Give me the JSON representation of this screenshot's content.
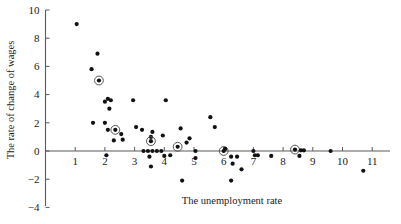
{
  "chart_data": {
    "type": "scatter",
    "title": "",
    "xlabel": "The unemployment rate",
    "ylabel": "The rate of change of wages",
    "xlim": [
      0,
      11.45
    ],
    "ylim": [
      -4,
      10
    ],
    "xticks": [
      1,
      2,
      3,
      4,
      5,
      6,
      7,
      8,
      9,
      10,
      11
    ],
    "yticks": [
      -4,
      -2,
      0,
      2,
      4,
      6,
      8,
      10
    ],
    "grid": false,
    "legend": null,
    "marker": "filled-circle",
    "highlight_marker": "filled-circle-with-ring",
    "points": [
      {
        "x": 1.05,
        "y": 9.0,
        "highlight": false
      },
      {
        "x": 1.55,
        "y": 5.8,
        "highlight": false
      },
      {
        "x": 1.75,
        "y": 6.9,
        "highlight": false
      },
      {
        "x": 1.8,
        "y": 5.0,
        "highlight": true
      },
      {
        "x": 1.6,
        "y": 2.0,
        "highlight": false
      },
      {
        "x": 2.0,
        "y": 3.5,
        "highlight": false
      },
      {
        "x": 2.1,
        "y": 3.7,
        "highlight": false
      },
      {
        "x": 2.15,
        "y": 3.0,
        "highlight": false
      },
      {
        "x": 2.0,
        "y": 2.0,
        "highlight": false
      },
      {
        "x": 2.1,
        "y": 1.5,
        "highlight": false
      },
      {
        "x": 2.2,
        "y": 3.6,
        "highlight": false
      },
      {
        "x": 2.35,
        "y": 1.5,
        "highlight": true
      },
      {
        "x": 2.05,
        "y": -0.3,
        "highlight": false
      },
      {
        "x": 2.3,
        "y": 0.75,
        "highlight": false
      },
      {
        "x": 2.6,
        "y": 0.8,
        "highlight": false
      },
      {
        "x": 2.55,
        "y": 1.2,
        "highlight": false
      },
      {
        "x": 2.95,
        "y": 3.6,
        "highlight": false
      },
      {
        "x": 3.05,
        "y": 1.7,
        "highlight": false
      },
      {
        "x": 3.25,
        "y": 1.5,
        "highlight": false
      },
      {
        "x": 3.3,
        "y": 0.0,
        "highlight": false
      },
      {
        "x": 3.45,
        "y": 0.0,
        "highlight": false
      },
      {
        "x": 3.5,
        "y": -0.4,
        "highlight": false
      },
      {
        "x": 3.55,
        "y": 1.0,
        "highlight": false
      },
      {
        "x": 3.6,
        "y": 0.0,
        "highlight": false
      },
      {
        "x": 3.6,
        "y": 1.35,
        "highlight": false
      },
      {
        "x": 3.55,
        "y": 0.7,
        "highlight": true
      },
      {
        "x": 3.55,
        "y": -1.1,
        "highlight": false
      },
      {
        "x": 3.75,
        "y": 0.0,
        "highlight": false
      },
      {
        "x": 3.9,
        "y": 0.0,
        "highlight": false
      },
      {
        "x": 3.95,
        "y": 1.1,
        "highlight": false
      },
      {
        "x": 4.0,
        "y": -0.35,
        "highlight": false
      },
      {
        "x": 4.05,
        "y": 3.6,
        "highlight": false
      },
      {
        "x": 4.2,
        "y": -0.3,
        "highlight": false
      },
      {
        "x": 4.45,
        "y": 0.3,
        "highlight": true
      },
      {
        "x": 4.55,
        "y": 1.6,
        "highlight": false
      },
      {
        "x": 4.6,
        "y": -2.1,
        "highlight": false
      },
      {
        "x": 5.05,
        "y": 0.0,
        "highlight": false
      },
      {
        "x": 4.85,
        "y": 0.9,
        "highlight": false
      },
      {
        "x": 4.75,
        "y": 0.6,
        "highlight": false
      },
      {
        "x": 5.05,
        "y": -0.5,
        "highlight": false
      },
      {
        "x": 5.55,
        "y": 2.4,
        "highlight": false
      },
      {
        "x": 5.7,
        "y": 1.7,
        "highlight": false
      },
      {
        "x": 6.0,
        "y": 0.0,
        "highlight": true
      },
      {
        "x": 6.05,
        "y": 0.15,
        "highlight": false
      },
      {
        "x": 6.25,
        "y": -0.4,
        "highlight": false
      },
      {
        "x": 6.45,
        "y": -0.4,
        "highlight": false
      },
      {
        "x": 6.3,
        "y": -0.9,
        "highlight": false
      },
      {
        "x": 6.25,
        "y": -2.1,
        "highlight": false
      },
      {
        "x": 6.6,
        "y": -1.3,
        "highlight": false
      },
      {
        "x": 7.0,
        "y": 0.0,
        "highlight": false
      },
      {
        "x": 7.05,
        "y": -0.3,
        "highlight": false
      },
      {
        "x": 7.15,
        "y": -0.3,
        "highlight": false
      },
      {
        "x": 7.6,
        "y": -0.35,
        "highlight": false
      },
      {
        "x": 8.4,
        "y": 0.1,
        "highlight": true
      },
      {
        "x": 8.6,
        "y": 0.05,
        "highlight": false
      },
      {
        "x": 8.7,
        "y": 0.05,
        "highlight": false
      },
      {
        "x": 8.55,
        "y": -0.35,
        "highlight": false
      },
      {
        "x": 9.6,
        "y": 0.0,
        "highlight": false
      },
      {
        "x": 10.7,
        "y": -1.4,
        "highlight": false
      }
    ]
  },
  "colors": {
    "marker": "#111111",
    "axis": "#5a5a5a",
    "background": "#ffffff"
  }
}
